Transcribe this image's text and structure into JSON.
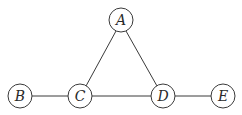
{
  "diagram": {
    "type": "undirected-graph",
    "style": {
      "stroke_color": "#3a3a3a",
      "text_color": "#2a2a2a",
      "background": "#ffffff"
    },
    "nodes": [
      {
        "id": "A",
        "label": "A",
        "x": 121,
        "y": 20,
        "r": 12
      },
      {
        "id": "B",
        "label": "B",
        "x": 20,
        "y": 96,
        "r": 12
      },
      {
        "id": "C",
        "label": "C",
        "x": 80,
        "y": 96,
        "r": 12
      },
      {
        "id": "D",
        "label": "D",
        "x": 163,
        "y": 96,
        "r": 12
      },
      {
        "id": "E",
        "label": "E",
        "x": 223,
        "y": 96,
        "r": 12
      }
    ],
    "edges": [
      {
        "from": "A",
        "to": "C"
      },
      {
        "from": "A",
        "to": "D"
      },
      {
        "from": "B",
        "to": "C"
      },
      {
        "from": "C",
        "to": "D"
      },
      {
        "from": "D",
        "to": "E"
      }
    ]
  }
}
